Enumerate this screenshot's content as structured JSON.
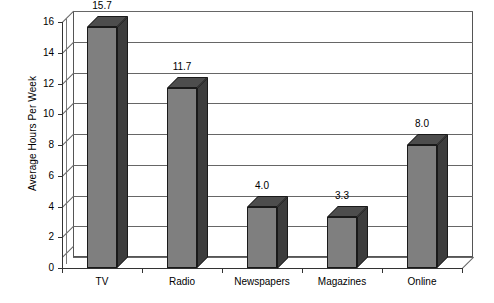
{
  "chart_data": {
    "type": "bar",
    "title": "",
    "subtitle": "",
    "xlabel": "",
    "ylabel": "Average Hours Per Week",
    "categories": [
      "TV",
      "Radio",
      "Newspapers",
      "Magazines",
      "Online"
    ],
    "values": [
      15.7,
      11.7,
      4.0,
      3.3,
      8.0
    ],
    "data_labels": [
      "15.7",
      "11.7",
      "4.0",
      "3.3",
      "8.0"
    ],
    "ylim": [
      0,
      16
    ],
    "ytick_step": 2,
    "ytick_labels": [
      "0",
      "2",
      "4",
      "6",
      "8",
      "10",
      "12",
      "14",
      "16"
    ],
    "grid": true,
    "grid_axis": "y",
    "legend": false,
    "legend_position": "none",
    "style_3d": true,
    "colors": {
      "bar_front": "#7f7f7f",
      "bar_side": "#3d3d3d",
      "bar_top": "#4d4d4d",
      "bar_outline": "#1a1a1a",
      "gridline": "#666666",
      "axis": "#333333",
      "background": "#ffffff",
      "text": "#000000"
    }
  }
}
